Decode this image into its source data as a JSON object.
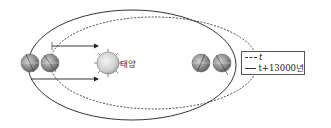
{
  "diagram": {
    "sun_label": "태양",
    "legend": {
      "items": [
        {
          "style": "dashed",
          "label": "t"
        },
        {
          "style": "solid",
          "label": "t+13000년"
        }
      ]
    },
    "colors": {
      "orbit": "#333333",
      "sun_fill": "#d8d8d8",
      "earth_fill": "#9a9a9a"
    }
  }
}
